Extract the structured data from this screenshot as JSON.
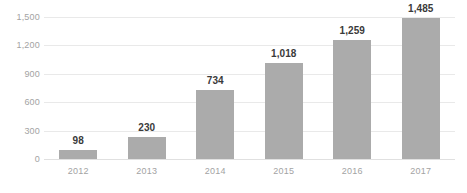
{
  "chart_data": {
    "type": "bar",
    "title": "",
    "subtitle": "",
    "xlabel": "",
    "ylabel": "",
    "categories": [
      "2012",
      "2013",
      "2014",
      "2015",
      "2016",
      "2017"
    ],
    "values": [
      98,
      230,
      734,
      1018,
      1259,
      1485
    ],
    "value_labels": [
      "98",
      "230",
      "734",
      "1,018",
      "1,259",
      "1,485"
    ],
    "ylim": [
      0,
      1500
    ],
    "yticks": [
      0,
      300,
      600,
      900,
      1200,
      1500
    ],
    "ytick_labels": [
      "0",
      "300",
      "600",
      "900",
      "1,200",
      "1,500"
    ],
    "grid": true,
    "legend": false,
    "legend_position": "none",
    "colors": {
      "bar": "#ababab",
      "gridline": "#e9e9e9",
      "baseline": "#e0e0e0",
      "tick_label": "#a3a3a3",
      "value_label": "#3a3a3a",
      "background": "#ffffff"
    }
  }
}
